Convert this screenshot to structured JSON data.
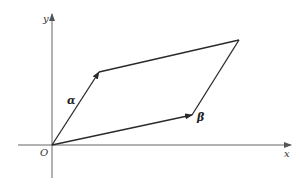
{
  "diagram": {
    "type": "parallelogram-vectors",
    "origin_label": "O",
    "x_axis_label": "x",
    "y_axis_label": "y",
    "vector_a_label": "α",
    "vector_b_label": "β",
    "colors": {
      "axis": "#666666",
      "line": "#2a2a2a",
      "background": "#ffffff"
    }
  }
}
